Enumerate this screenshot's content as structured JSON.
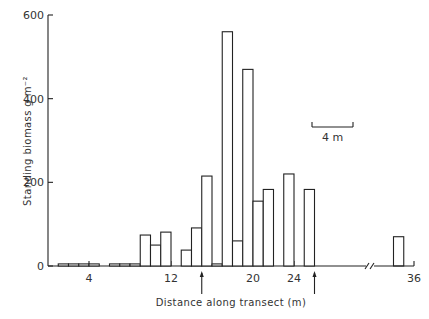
{
  "chart_data": {
    "type": "bar",
    "title": "",
    "xlabel": "Distance along transect (m)",
    "ylabel": "Standing biomass g m⁻²",
    "ylim": [
      0,
      600
    ],
    "yticks": [
      0,
      200,
      400,
      600
    ],
    "xticks": [
      4,
      12,
      20,
      24,
      36
    ],
    "axis_break": "between 26 and 34 m",
    "bin_width_m": 1,
    "bars": [
      {
        "x0": 1,
        "x1": 2,
        "value": 5
      },
      {
        "x0": 2,
        "x1": 3,
        "value": 5
      },
      {
        "x0": 3,
        "x1": 4,
        "value": 5
      },
      {
        "x0": 4,
        "x1": 5,
        "value": 5
      },
      {
        "x0": 6,
        "x1": 7,
        "value": 5
      },
      {
        "x0": 7,
        "x1": 8,
        "value": 5
      },
      {
        "x0": 8,
        "x1": 9,
        "value": 5
      },
      {
        "x0": 9,
        "x1": 10,
        "value": 74
      },
      {
        "x0": 10,
        "x1": 11,
        "value": 50
      },
      {
        "x0": 11,
        "x1": 12,
        "value": 81
      },
      {
        "x0": 13,
        "x1": 14,
        "value": 38
      },
      {
        "x0": 14,
        "x1": 15,
        "value": 91
      },
      {
        "x0": 15,
        "x1": 16,
        "value": 215
      },
      {
        "x0": 16,
        "x1": 17,
        "value": 5
      },
      {
        "x0": 17,
        "x1": 18,
        "value": 560
      },
      {
        "x0": 18,
        "x1": 19,
        "value": 60
      },
      {
        "x0": 19,
        "x1": 20,
        "value": 470
      },
      {
        "x0": 20,
        "x1": 21,
        "value": 155
      },
      {
        "x0": 21,
        "x1": 22,
        "value": 183
      },
      {
        "x0": 23,
        "x1": 24,
        "value": 220
      },
      {
        "x0": 25,
        "x1": 26,
        "value": 183
      },
      {
        "x0": 34,
        "x1": 35,
        "value": 70
      }
    ],
    "annotations": [
      {
        "type": "arrow",
        "x": 15,
        "direction": "up"
      },
      {
        "type": "arrow",
        "x": 26,
        "direction": "up"
      },
      {
        "type": "scale_bar",
        "label": "4 m",
        "length_m": 4
      }
    ],
    "legend": "none",
    "grid": false
  }
}
